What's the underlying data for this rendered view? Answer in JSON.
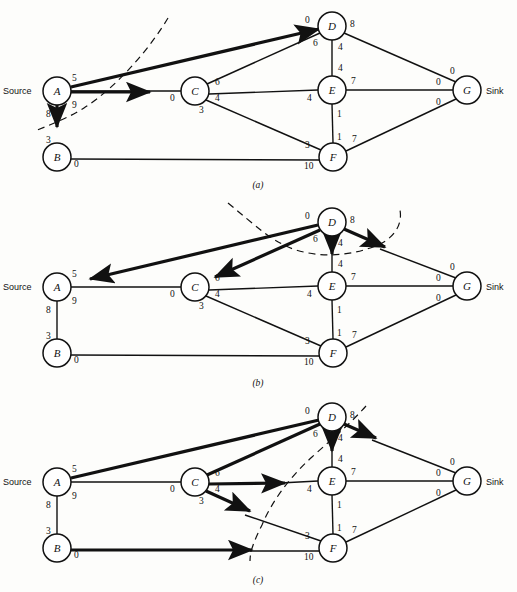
{
  "figure": {
    "source_label": "Source",
    "sink_label": "Sink"
  },
  "nodes": [
    {
      "id": "A",
      "label": "A",
      "cx": 57,
      "cy": 91
    },
    {
      "id": "B",
      "label": "B",
      "cx": 57,
      "cy": 157
    },
    {
      "id": "C",
      "label": "C",
      "cx": 195,
      "cy": 91
    },
    {
      "id": "D",
      "label": "D",
      "cx": 332,
      "cy": 26
    },
    {
      "id": "E",
      "label": "E",
      "cx": 332,
      "cy": 90
    },
    {
      "id": "F",
      "label": "F",
      "cx": 333,
      "cy": 157
    },
    {
      "id": "G",
      "label": "G",
      "cx": 467,
      "cy": 90
    }
  ],
  "edges": [
    {
      "id": "A-D",
      "from": "A",
      "to": "D",
      "near_label": "5",
      "far_label": "0"
    },
    {
      "id": "A-C",
      "from": "A",
      "to": "C",
      "near_label": "9",
      "far_label": "0"
    },
    {
      "id": "A-B",
      "from": "A",
      "to": "B",
      "near_label": "8",
      "far_label": "3"
    },
    {
      "id": "C-D",
      "from": "C",
      "to": "D",
      "near_label": "6",
      "far_label": "6"
    },
    {
      "id": "C-E",
      "from": "C",
      "to": "E",
      "near_label": "4",
      "far_label": "4"
    },
    {
      "id": "C-F",
      "from": "C",
      "to": "F",
      "near_label": "3",
      "far_label": "3"
    },
    {
      "id": "B-F",
      "from": "B",
      "to": "F",
      "near_label": "0",
      "far_label": "10"
    },
    {
      "id": "D-E",
      "from": "D",
      "to": "E",
      "near_label": "4",
      "far_label": "4"
    },
    {
      "id": "D-G",
      "from": "D",
      "to": "G",
      "near_label": "8",
      "far_label": "0"
    },
    {
      "id": "E-F",
      "from": "E",
      "to": "F",
      "near_label": "1",
      "far_label": "1"
    },
    {
      "id": "E-G",
      "from": "E",
      "to": "G",
      "near_label": "7",
      "far_label": "0"
    },
    {
      "id": "F-G",
      "from": "F",
      "to": "G",
      "near_label": "7",
      "far_label": "0"
    }
  ],
  "panels": [
    {
      "id": "a",
      "caption": "(a)",
      "bold_edges": [
        "A-D",
        "A-C",
        "A-B"
      ],
      "cut_description": "cut separating A from rest of network",
      "arrow_edges": [
        "A-D",
        "A-C",
        "A-B"
      ]
    },
    {
      "id": "b",
      "caption": "(b)",
      "bold_edges": [
        "A-D",
        "C-D",
        "D-E",
        "D-G"
      ],
      "cut_description": "closed cut around node D",
      "arrow_edges": [
        "A-D",
        "C-D",
        "D-E",
        "D-G"
      ]
    },
    {
      "id": "c",
      "caption": "(c)",
      "bold_edges": [
        "A-D",
        "C-D",
        "C-E",
        "C-F",
        "B-F",
        "D-E",
        "D-G"
      ],
      "cut_description": "cut separating A, B, C from D, E, F, G",
      "arrow_edges": [
        "C-E",
        "C-F",
        "B-F",
        "D-E",
        "D-G"
      ]
    }
  ],
  "labels": {
    "capacities_note": "numbers beside each node end of an arc are residual capacities"
  }
}
